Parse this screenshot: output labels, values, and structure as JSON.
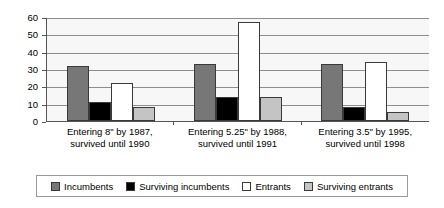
{
  "chart_data": {
    "type": "bar",
    "title": "",
    "xlabel": "",
    "ylabel": "",
    "ylim": [
      0,
      60
    ],
    "ytick_values": [
      0,
      10,
      20,
      30,
      40,
      50,
      60
    ],
    "ytick_labels": [
      "0",
      "10",
      "20",
      "30",
      "40",
      "50",
      "60"
    ],
    "grid": true,
    "legend_position": "bottom",
    "categories": [
      "Entering 8\" by 1987, survived until 1990",
      "Entering 5.25\" by 1988, survived until 1991",
      "Entering 3.5\" by 1995, survived until 1998"
    ],
    "category_lines": [
      [
        "Entering 8\" by 1987,",
        "survived until 1990"
      ],
      [
        "Entering 5.25\" by 1988,",
        "survived until 1991"
      ],
      [
        "Entering 3.5\" by 1995,",
        "survived until 1998"
      ]
    ],
    "series": [
      {
        "name": "Incumbents",
        "key": "incumbents",
        "color": "#777777",
        "values": [
          32,
          33,
          33
        ]
      },
      {
        "name": "Surviving incumbents",
        "key": "surv-incumbents",
        "color": "#000000",
        "values": [
          11,
          14,
          8
        ]
      },
      {
        "name": "Entrants",
        "key": "entrants",
        "color": "#ffffff",
        "values": [
          22,
          57,
          34
        ]
      },
      {
        "name": "Surviving entrants",
        "key": "surv-entrants",
        "color": "#c4c4c4",
        "values": [
          8,
          14,
          5
        ]
      }
    ]
  }
}
